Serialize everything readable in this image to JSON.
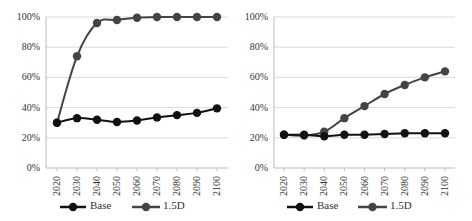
{
  "chart_data": [
    {
      "type": "line",
      "title": "",
      "xlabel": "",
      "ylabel": "",
      "ylim": [
        0,
        100
      ],
      "y_ticks": [
        "0%",
        "20%",
        "40%",
        "60%",
        "80%",
        "100%"
      ],
      "grid": true,
      "legend_position": "bottom",
      "categories": [
        "2020",
        "2030",
        "2040",
        "2050",
        "2060",
        "2070",
        "2080",
        "2090",
        "2100"
      ],
      "series": [
        {
          "name": "Base",
          "color": "#111111",
          "values": [
            30,
            33,
            32,
            30.5,
            31.5,
            33.5,
            35,
            36.5,
            39.5
          ]
        },
        {
          "name": "1.5D",
          "color": "#444444",
          "values": [
            30,
            74,
            96,
            98,
            99.5,
            100,
            100,
            100,
            100
          ]
        }
      ]
    },
    {
      "type": "line",
      "title": "",
      "xlabel": "",
      "ylabel": "",
      "ylim": [
        0,
        100
      ],
      "y_ticks": [
        "0%",
        "20%",
        "40%",
        "60%",
        "80%",
        "100%"
      ],
      "grid": true,
      "legend_position": "bottom",
      "categories": [
        "2020",
        "2030",
        "2040",
        "2050",
        "2060",
        "2070",
        "2080",
        "2090",
        "2100"
      ],
      "series": [
        {
          "name": "Base",
          "color": "#111111",
          "values": [
            22,
            22,
            21,
            22,
            22,
            22.5,
            23,
            23,
            23
          ]
        },
        {
          "name": "1.5D",
          "color": "#444444",
          "values": [
            22,
            21.5,
            24,
            33,
            41,
            49,
            55,
            60,
            64
          ]
        }
      ]
    }
  ],
  "legend": {
    "base_label": "Base",
    "d15_label": "1.5D"
  }
}
